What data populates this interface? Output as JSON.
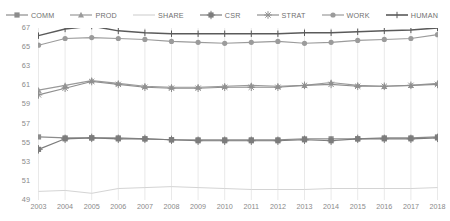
{
  "chart_data": {
    "type": "line",
    "title": "",
    "xlabel": "",
    "ylabel": "",
    "ylim": [
      49,
      67
    ],
    "yticks": [
      49,
      51,
      53,
      55,
      57,
      59,
      61,
      63,
      65,
      67
    ],
    "grid": "vertical",
    "legend_position": "top-center",
    "categories": [
      "2003",
      "2004",
      "2005",
      "2006",
      "2007",
      "2008",
      "2009",
      "2010",
      "2011",
      "2012",
      "2013",
      "2014",
      "2015",
      "2016",
      "2017",
      "2018"
    ],
    "series": [
      {
        "name": "COMM",
        "marker": "square",
        "color": "#8c8c8c",
        "values": [
          55.6,
          55.5,
          55.5,
          55.5,
          55.4,
          55.3,
          55.3,
          55.3,
          55.3,
          55.3,
          55.4,
          55.4,
          55.4,
          55.5,
          55.5,
          55.6
        ]
      },
      {
        "name": "PROD",
        "marker": "triangle",
        "color": "#9a9a9a",
        "values": [
          60.5,
          61.0,
          61.5,
          61.2,
          60.9,
          60.8,
          60.8,
          60.9,
          61.0,
          60.9,
          61.0,
          61.3,
          61.0,
          60.9,
          61.0,
          61.2
        ]
      },
      {
        "name": "SHARE",
        "marker": "none",
        "color": "#d4d4d4",
        "values": [
          49.9,
          50.0,
          49.7,
          50.2,
          50.3,
          50.4,
          50.3,
          50.2,
          50.1,
          50.1,
          50.1,
          50.2,
          50.2,
          50.2,
          50.2,
          50.3
        ]
      },
      {
        "name": "CSR",
        "marker": "cross-square",
        "color": "#7c7c7c",
        "values": [
          54.3,
          55.4,
          55.5,
          55.4,
          55.4,
          55.3,
          55.2,
          55.2,
          55.2,
          55.2,
          55.3,
          55.2,
          55.4,
          55.4,
          55.4,
          55.5
        ]
      },
      {
        "name": "STRAT",
        "marker": "asterisk",
        "color": "#8f8f8f",
        "values": [
          60.0,
          60.7,
          61.4,
          61.1,
          60.8,
          60.7,
          60.7,
          60.8,
          60.8,
          60.8,
          61.0,
          61.1,
          60.9,
          60.9,
          61.0,
          61.1
        ]
      },
      {
        "name": "WORK",
        "marker": "circle",
        "color": "#9b9b9b",
        "values": [
          65.2,
          65.9,
          66.0,
          65.9,
          65.8,
          65.6,
          65.5,
          65.4,
          65.5,
          65.6,
          65.4,
          65.5,
          65.7,
          65.8,
          65.9,
          66.3
        ]
      },
      {
        "name": "HUMAN",
        "marker": "plus-line",
        "color": "#5a5a5a",
        "values": [
          66.2,
          66.9,
          67.2,
          66.7,
          66.5,
          66.4,
          66.4,
          66.4,
          66.4,
          66.4,
          66.5,
          66.5,
          66.6,
          66.7,
          66.8,
          67.0
        ]
      }
    ]
  }
}
